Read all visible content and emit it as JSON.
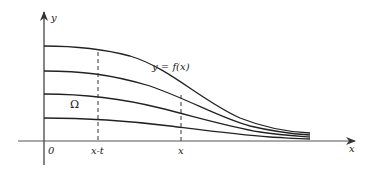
{
  "diagram": {
    "labels": {
      "y_axis": "y",
      "x_axis": "x",
      "origin": "0",
      "x_minus_t": "x-t",
      "x_mark": "x",
      "curve": "y = f(x)",
      "region": "Ω"
    },
    "colors": {
      "stroke": "#222222",
      "axis": "#444444",
      "background": "#ffffff"
    },
    "curves": {
      "count": 4,
      "start_heights_px": [
        46,
        71,
        94,
        118
      ],
      "description": "Four decreasing sigmoid-like curves converging toward the x-axis"
    },
    "dashed_lines": [
      {
        "label": "x-t",
        "x_px": 98
      },
      {
        "label": "x",
        "x_px": 181
      }
    ]
  }
}
